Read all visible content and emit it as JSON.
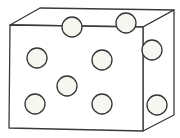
{
  "diagram": {
    "type": "isometric-box-with-circles",
    "colors": {
      "background": "#ffffff",
      "stroke": "#3a3a3a",
      "circle_fill": "#f7f7f2",
      "circle_stroke": "#333333"
    },
    "box": {
      "front_face": [
        [
          10,
          25
        ],
        [
          143,
          27
        ],
        [
          143,
          131
        ],
        [
          9,
          128
        ]
      ],
      "top_face": [
        [
          10,
          25
        ],
        [
          40,
          8
        ],
        [
          174,
          10
        ],
        [
          143,
          27
        ]
      ],
      "right_face": [
        [
          143,
          27
        ],
        [
          174,
          10
        ],
        [
          174,
          115
        ],
        [
          143,
          131
        ]
      ]
    },
    "circles": [
      {
        "id": "top-1",
        "cx": 72,
        "cy": 27,
        "r": 10
      },
      {
        "id": "top-2",
        "cx": 126,
        "cy": 23,
        "r": 10
      },
      {
        "id": "right-upper",
        "cx": 152,
        "cy": 50,
        "r": 10
      },
      {
        "id": "front-1",
        "cx": 37,
        "cy": 58,
        "r": 10
      },
      {
        "id": "front-2",
        "cx": 102,
        "cy": 60,
        "r": 10
      },
      {
        "id": "front-3",
        "cx": 67,
        "cy": 86,
        "r": 10
      },
      {
        "id": "front-4",
        "cx": 35,
        "cy": 104,
        "r": 10
      },
      {
        "id": "front-5",
        "cx": 102,
        "cy": 104,
        "r": 10
      },
      {
        "id": "right-lower",
        "cx": 157,
        "cy": 105,
        "r": 10
      }
    ],
    "circle_count": 9
  }
}
